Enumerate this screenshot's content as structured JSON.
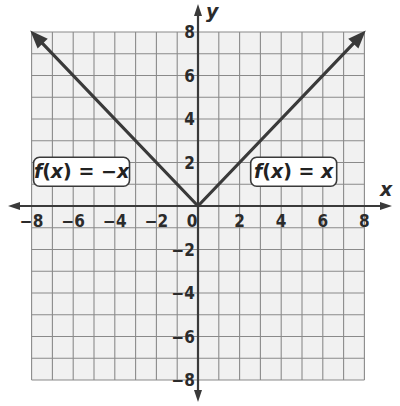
{
  "chart_data": {
    "type": "line",
    "title": "",
    "xlabel": "x",
    "ylabel": "y",
    "xlim": [
      -8,
      8
    ],
    "ylim": [
      -8,
      8
    ],
    "grid": true,
    "grid_step": 1,
    "x_ticks": [
      -8,
      -6,
      -4,
      -2,
      0,
      2,
      4,
      6,
      8
    ],
    "y_ticks": [
      -8,
      -6,
      -4,
      -2,
      2,
      4,
      6,
      8
    ],
    "x_tick_labels": [
      "−8",
      "−6",
      "−4",
      "−2",
      "0",
      "2",
      "4",
      "6",
      "8"
    ],
    "y_tick_labels": [
      "−8",
      "−6",
      "−4",
      "−2",
      "2",
      "4",
      "6",
      "8"
    ],
    "series": [
      {
        "name": "f(x) = -x",
        "label": "f(x) = −x",
        "x": [
          0,
          -7.8
        ],
        "y": [
          0,
          7.8
        ],
        "arrow": "end",
        "color": "#3a3a3a"
      },
      {
        "name": "f(x) = x",
        "label": "f(x) = x",
        "x": [
          0,
          7.8
        ],
        "y": [
          0,
          7.8
        ],
        "arrow": "end",
        "color": "#3a3a3a"
      }
    ],
    "annotations": [
      {
        "text_f": "f",
        "text_open": "(",
        "text_var": "x",
        "text_close": ")",
        "text_eq": " = −",
        "text_rhs": "x",
        "near": "left-series",
        "position_data": [
          -5.6,
          1.6
        ]
      },
      {
        "text_f": "f",
        "text_open": "(",
        "text_var": "x",
        "text_close": ")",
        "text_eq": " = ",
        "text_rhs": "x",
        "near": "right-series",
        "position_data": [
          4.6,
          1.6
        ]
      }
    ],
    "colors": {
      "grid_bg": "#f1f1f1",
      "grid_line": "#8a8a8a",
      "axis": "#3a3a3a",
      "line": "#3a3a3a"
    }
  }
}
